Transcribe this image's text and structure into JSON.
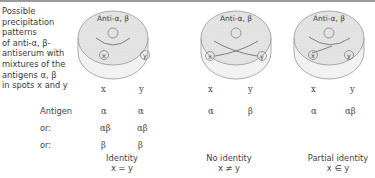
{
  "description": {
    "lines": [
      "Possible",
      "precipitation",
      "patterns",
      "of anti-α, β-",
      "antiserum with",
      "mixtures of the",
      "antigens α, β",
      "in spots x and y"
    ]
  },
  "dishes": [
    {
      "antiserum_label": "Anti-α, β",
      "spot_x": "x",
      "spot_y": "y",
      "col_x": "x",
      "col_y": "y",
      "pattern": "identity"
    },
    {
      "antiserum_label": "Anti-α, β",
      "spot_x": "x",
      "spot_y": "y",
      "col_x": "x",
      "col_y": "y",
      "pattern": "no-identity"
    },
    {
      "antiserum_label": "Anti-α, β",
      "spot_x": "x",
      "spot_y": "y",
      "col_x": "x",
      "col_y": "y",
      "pattern": "partial-identity"
    }
  ],
  "rows": {
    "labels": [
      "Antigen",
      "or:",
      "or:"
    ],
    "identity": [
      [
        "α",
        "α"
      ],
      [
        "αβ",
        "αβ"
      ],
      [
        "β",
        "β"
      ]
    ],
    "no_identity": [
      [
        "α",
        "β"
      ]
    ],
    "partial_identity": [
      [
        "α",
        "αβ"
      ]
    ]
  },
  "captions": [
    {
      "title": "Identity",
      "formula": "x = y"
    },
    {
      "title": "No identity",
      "formula": "x ≠ y"
    },
    {
      "title": "Partial identity",
      "formula": "x ∈ y"
    }
  ],
  "colors": {
    "dish_fill": "#e6e6e6",
    "dish_side": "#efefef",
    "stroke": "#8a8a8a",
    "text": "#444444"
  }
}
